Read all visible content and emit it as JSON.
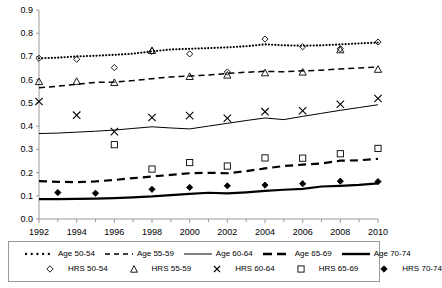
{
  "chart_data": {
    "type": "line",
    "title": "",
    "subtitle": "",
    "xlabel": "",
    "ylabel": "",
    "xlim": [
      1992,
      2010
    ],
    "ylim": [
      0.0,
      0.9
    ],
    "grid": false,
    "legend_position": "bottom",
    "x_ticks": [
      "1992",
      "1994",
      "1996",
      "1998",
      "2000",
      "2002",
      "2004",
      "2006",
      "2008",
      "2010"
    ],
    "x_tick_values": [
      1992,
      1994,
      1996,
      1998,
      2000,
      2002,
      2004,
      2006,
      2008,
      2010
    ],
    "x_minor_ticks": [
      1993,
      1995,
      1997,
      1999,
      2001,
      2003,
      2005,
      2007,
      2009
    ],
    "y_ticks": [
      "0.0",
      "0.1",
      "0.2",
      "0.3",
      "0.4",
      "0.5",
      "0.6",
      "0.7",
      "0.8",
      "0.9"
    ],
    "y_tick_values": [
      0.0,
      0.1,
      0.2,
      0.3,
      0.4,
      0.5,
      0.6,
      0.7,
      0.8,
      0.9
    ],
    "x": [
      1992,
      1993,
      1994,
      1995,
      1996,
      1997,
      1998,
      1999,
      2000,
      2001,
      2002,
      2003,
      2004,
      2005,
      2006,
      2007,
      2008,
      2009,
      2010
    ],
    "series": [
      {
        "name": "Age 50-54",
        "style": "dotted",
        "kind": "line",
        "color": "#000000",
        "values": [
          0.692,
          0.695,
          0.7,
          0.703,
          0.707,
          0.712,
          0.722,
          0.73,
          0.733,
          0.736,
          0.739,
          0.744,
          0.752,
          0.748,
          0.746,
          0.748,
          0.752,
          0.756,
          0.76
        ]
      },
      {
        "name": "Age 55-59",
        "style": "dashed",
        "kind": "line",
        "color": "#000000",
        "values": [
          0.565,
          0.572,
          0.58,
          0.588,
          0.59,
          0.596,
          0.604,
          0.612,
          0.616,
          0.62,
          0.627,
          0.632,
          0.636,
          0.634,
          0.638,
          0.641,
          0.646,
          0.65,
          0.655
        ]
      },
      {
        "name": "Age 60-64",
        "style": "solid-thin",
        "kind": "line",
        "color": "#000000",
        "values": [
          0.368,
          0.37,
          0.374,
          0.378,
          0.383,
          0.39,
          0.397,
          0.392,
          0.388,
          0.4,
          0.412,
          0.424,
          0.435,
          0.428,
          0.442,
          0.455,
          0.468,
          0.48,
          0.492
        ]
      },
      {
        "name": "Age 65-69",
        "style": "dashed-thick",
        "kind": "line",
        "color": "#000000",
        "values": [
          0.163,
          0.16,
          0.159,
          0.162,
          0.168,
          0.176,
          0.183,
          0.19,
          0.197,
          0.199,
          0.197,
          0.206,
          0.218,
          0.228,
          0.234,
          0.239,
          0.251,
          0.253,
          0.259
        ]
      },
      {
        "name": "Age 70-74",
        "style": "solid-thick",
        "kind": "line",
        "color": "#000000",
        "values": [
          0.086,
          0.086,
          0.087,
          0.088,
          0.09,
          0.093,
          0.097,
          0.103,
          0.108,
          0.113,
          0.11,
          0.115,
          0.121,
          0.126,
          0.13,
          0.14,
          0.143,
          0.147,
          0.153
        ]
      },
      {
        "name": "HRS 50-54",
        "kind": "markers",
        "marker": "diamond-open",
        "color": "#000000",
        "x": [
          1992,
          1994,
          1996,
          1998,
          2000,
          2002,
          2004,
          2006,
          2008,
          2010
        ],
        "values": [
          0.692,
          0.688,
          0.652,
          0.722,
          0.711,
          0.633,
          0.775,
          0.742,
          0.733,
          0.762
        ]
      },
      {
        "name": "HRS 55-59",
        "kind": "markers",
        "marker": "triangle-open",
        "color": "#000000",
        "x": [
          1992,
          1994,
          1996,
          1998,
          2000,
          2002,
          2004,
          2006,
          2008,
          2010
        ],
        "values": [
          0.592,
          0.593,
          0.588,
          0.726,
          0.614,
          0.62,
          0.63,
          0.633,
          0.729,
          0.645
        ]
      },
      {
        "name": "HRS 60-64",
        "kind": "markers",
        "marker": "cross",
        "color": "#000000",
        "x": [
          1992,
          1994,
          1996,
          1998,
          2000,
          2002,
          2004,
          2006,
          2008,
          2010
        ],
        "values": [
          0.506,
          0.447,
          0.376,
          0.437,
          0.445,
          0.434,
          0.462,
          0.466,
          0.494,
          0.519
        ]
      },
      {
        "name": "HRS 65-69",
        "kind": "markers",
        "marker": "square-open",
        "color": "#000000",
        "x": [
          1996,
          1998,
          2000,
          2002,
          2004,
          2006,
          2008,
          2010
        ],
        "values": [
          0.32,
          0.215,
          0.243,
          0.228,
          0.263,
          0.262,
          0.281,
          0.304
        ]
      },
      {
        "name": "HRS 70-74",
        "kind": "markers",
        "marker": "diamond-filled",
        "color": "#000000",
        "x": [
          1993,
          1995,
          1998,
          2000,
          2002,
          2004,
          2006,
          2008,
          2010
        ],
        "values": [
          0.114,
          0.111,
          0.128,
          0.136,
          0.143,
          0.146,
          0.152,
          0.163,
          0.161
        ]
      }
    ]
  },
  "legend": {
    "row1": [
      {
        "label": "Age 50-54",
        "key": "dotted-line-key"
      },
      {
        "label": "Age 55-59",
        "key": "dashed-line-key"
      },
      {
        "label": "Age 60-64",
        "key": "thin-solid-line-key"
      },
      {
        "label": "Age 65-69",
        "key": "thick-dashed-line-key"
      },
      {
        "label": "Age 70-74",
        "key": "thick-solid-line-key"
      }
    ],
    "row2": [
      {
        "label": "HRS 50-54",
        "key": "diamond-open-marker"
      },
      {
        "label": "HRS 55-59",
        "key": "triangle-open-marker"
      },
      {
        "label": "HRS 60-64",
        "key": "cross-marker"
      },
      {
        "label": "HRS 65-69",
        "key": "square-open-marker"
      },
      {
        "label": "HRS 70-74",
        "key": "diamond-filled-marker"
      }
    ]
  }
}
